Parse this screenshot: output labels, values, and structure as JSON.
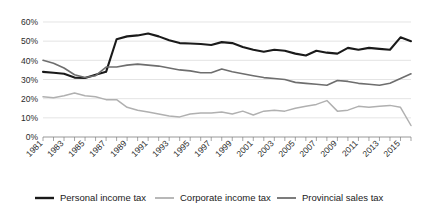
{
  "chart_data": {
    "type": "line",
    "title": "",
    "xlabel": "",
    "ylabel": "",
    "ylim": [
      0,
      60
    ],
    "ytick_labels": [
      "60%",
      "50%",
      "40%",
      "30%",
      "20%",
      "10%",
      "0%"
    ],
    "ytick_values": [
      60,
      50,
      40,
      30,
      20,
      10,
      0
    ],
    "grid": true,
    "legend_position": "bottom",
    "x": [
      1981,
      1982,
      1983,
      1984,
      1985,
      1986,
      1987,
      1988,
      1989,
      1990,
      1991,
      1992,
      1993,
      1994,
      1995,
      1996,
      1997,
      1998,
      1999,
      2000,
      2001,
      2002,
      2003,
      2004,
      2005,
      2006,
      2007,
      2008,
      2009,
      2010,
      2011,
      2012,
      2013,
      2014,
      2015,
      2016
    ],
    "xtick_labels": [
      "1981",
      "1983",
      "1985",
      "1987",
      "1989",
      "1991",
      "1993",
      "1995",
      "1997",
      "1999",
      "2001",
      "2003",
      "2005",
      "2007",
      "2009",
      "2011",
      "2013",
      "2015"
    ],
    "series": [
      {
        "name": "Personal income tax",
        "color": "#1a1a1a",
        "width": 2.1,
        "values": [
          34.0,
          33.5,
          33.0,
          31.0,
          30.8,
          32.5,
          34.0,
          51.0,
          52.5,
          53.0,
          54.0,
          52.5,
          50.5,
          49.0,
          48.8,
          48.5,
          48.0,
          49.5,
          49.0,
          47.0,
          45.5,
          44.5,
          45.5,
          45.0,
          43.5,
          42.5,
          45.0,
          44.0,
          43.5,
          46.5,
          45.5,
          46.5,
          46.0,
          45.5,
          52.0,
          50.0
        ]
      },
      {
        "name": "Corporate income tax",
        "color": "#b0b0b0",
        "width": 1.5,
        "values": [
          21.0,
          20.5,
          21.5,
          23.0,
          21.5,
          21.0,
          19.5,
          19.5,
          15.5,
          14.0,
          13.0,
          12.0,
          11.0,
          10.5,
          12.0,
          12.5,
          12.5,
          13.0,
          12.0,
          13.5,
          11.5,
          13.5,
          14.0,
          13.5,
          15.0,
          16.0,
          17.0,
          19.0,
          13.5,
          14.0,
          16.0,
          15.5,
          16.0,
          16.5,
          15.5,
          6.0
        ]
      },
      {
        "name": "Provincial sales tax",
        "color": "#6e6e6e",
        "width": 1.6,
        "values": [
          40.0,
          38.5,
          36.0,
          32.5,
          31.0,
          32.0,
          36.5,
          36.5,
          37.5,
          38.0,
          37.5,
          37.0,
          36.0,
          35.0,
          34.5,
          33.5,
          33.5,
          35.5,
          34.0,
          33.0,
          32.0,
          31.0,
          30.5,
          30.0,
          28.5,
          28.0,
          27.5,
          27.0,
          29.5,
          29.0,
          28.0,
          27.5,
          27.0,
          28.0,
          30.5,
          33.0
        ]
      }
    ]
  },
  "legend": {
    "items": [
      {
        "label": "Personal income tax"
      },
      {
        "label": "Corporate income tax"
      },
      {
        "label": "Provincial sales tax"
      }
    ]
  }
}
